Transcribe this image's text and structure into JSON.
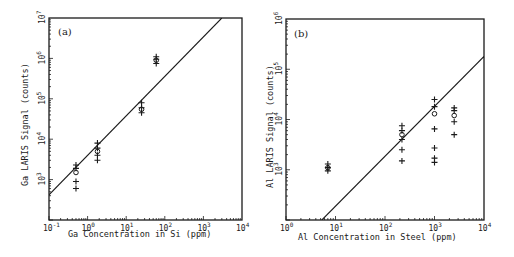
{
  "colors": {
    "ink": "#1a1a1a",
    "background": "#ffffff"
  },
  "chart_data": [
    {
      "type": "scatter",
      "panel": "(a)",
      "title": "",
      "xlabel": "Ga Concentration in Si (ppm)",
      "ylabel": "Ga LARIS Signal (counts)",
      "xscale": "log",
      "yscale": "log",
      "xlim": [
        0.1,
        10000
      ],
      "ylim": [
        100,
        10000000
      ],
      "x_tick_labels": [
        "10^-1",
        "10^0",
        "10^1",
        "10^2",
        "10^3",
        "10^4"
      ],
      "y_tick_labels": [
        "10^3",
        "10^4",
        "10^5",
        "10^6",
        "10^7"
      ],
      "grid": false,
      "series": [
        {
          "name": "individual measurements",
          "marker": "+",
          "points": [
            [
              0.5,
              2300
            ],
            [
              0.5,
              1900
            ],
            [
              0.5,
              900
            ],
            [
              0.5,
              600
            ],
            [
              1.8,
              8000
            ],
            [
              1.8,
              6000
            ],
            [
              1.8,
              4000
            ],
            [
              1.8,
              3000
            ],
            [
              25,
              80000
            ],
            [
              25,
              60000
            ],
            [
              25,
              45000
            ],
            [
              60,
              1100000
            ],
            [
              60,
              950000
            ],
            [
              60,
              750000
            ]
          ]
        },
        {
          "name": "mean",
          "marker": "o",
          "points": [
            [
              0.5,
              1500
            ],
            [
              1.8,
              5000
            ],
            [
              25,
              55000
            ],
            [
              60,
              900000
            ]
          ]
        },
        {
          "name": "fit line",
          "marker": "line",
          "points": [
            [
              0.1,
              420
            ],
            [
              3000,
              10000000
            ]
          ]
        }
      ]
    },
    {
      "type": "scatter",
      "panel": "(b)",
      "title": "",
      "xlabel": "Al Concentration in Steel (ppm)",
      "ylabel": "Al LARIS Signal (counts)",
      "xscale": "log",
      "yscale": "log",
      "xlim": [
        1,
        10000
      ],
      "ylim": [
        100,
        1000000
      ],
      "x_tick_labels": [
        "10^0",
        "10^1",
        "10^2",
        "10^3",
        "10^4"
      ],
      "y_tick_labels": [
        "10^3",
        "10^4",
        "10^5",
        "10^6"
      ],
      "grid": false,
      "series": [
        {
          "name": "individual measurements",
          "marker": "+",
          "points": [
            [
              7,
              1300
            ],
            [
              7,
              1100
            ],
            [
              7,
              950
            ],
            [
              220,
              7500
            ],
            [
              220,
              6000
            ],
            [
              220,
              4000
            ],
            [
              220,
              2500
            ],
            [
              220,
              1500
            ],
            [
              1000,
              25000
            ],
            [
              1000,
              18000
            ],
            [
              1000,
              6500
            ],
            [
              1000,
              2700
            ],
            [
              1000,
              1700
            ],
            [
              1000,
              1400
            ],
            [
              2500,
              17000
            ],
            [
              2500,
              15000
            ],
            [
              2500,
              9000
            ],
            [
              2500,
              5000
            ]
          ]
        },
        {
          "name": "mean",
          "marker": "o",
          "points": [
            [
              7,
              1100
            ],
            [
              220,
              5000
            ],
            [
              1000,
              13000
            ],
            [
              2500,
              12000
            ]
          ]
        },
        {
          "name": "fit line",
          "marker": "line",
          "points": [
            [
              5.3,
              100
            ],
            [
              10000,
              180000
            ]
          ]
        }
      ]
    }
  ],
  "panels": {
    "a": {
      "label": "(a)",
      "xlabel": "Ga Concentration in Si (ppm)",
      "ylabel": "Ga LARIS Signal (counts)",
      "xticks": [
        {
          "base": "10",
          "exp": "-1"
        },
        {
          "base": "10",
          "exp": "0"
        },
        {
          "base": "10",
          "exp": "1"
        },
        {
          "base": "10",
          "exp": "2"
        },
        {
          "base": "10",
          "exp": "3"
        },
        {
          "base": "10",
          "exp": "4"
        }
      ],
      "yticks": [
        {
          "base": "10",
          "exp": "3"
        },
        {
          "base": "10",
          "exp": "4"
        },
        {
          "base": "10",
          "exp": "5"
        },
        {
          "base": "10",
          "exp": "6"
        },
        {
          "base": "10",
          "exp": "7"
        }
      ]
    },
    "b": {
      "label": "(b)",
      "xlabel": "Al Concentration in Steel (ppm)",
      "ylabel": "Al LARIS Signal (counts)",
      "xticks": [
        {
          "base": "10",
          "exp": "0"
        },
        {
          "base": "10",
          "exp": "1"
        },
        {
          "base": "10",
          "exp": "2"
        },
        {
          "base": "10",
          "exp": "3"
        },
        {
          "base": "10",
          "exp": "4"
        }
      ],
      "yticks": [
        {
          "base": "10",
          "exp": "3"
        },
        {
          "base": "10",
          "exp": "4"
        },
        {
          "base": "10",
          "exp": "5"
        },
        {
          "base": "10",
          "exp": "6"
        }
      ]
    }
  }
}
